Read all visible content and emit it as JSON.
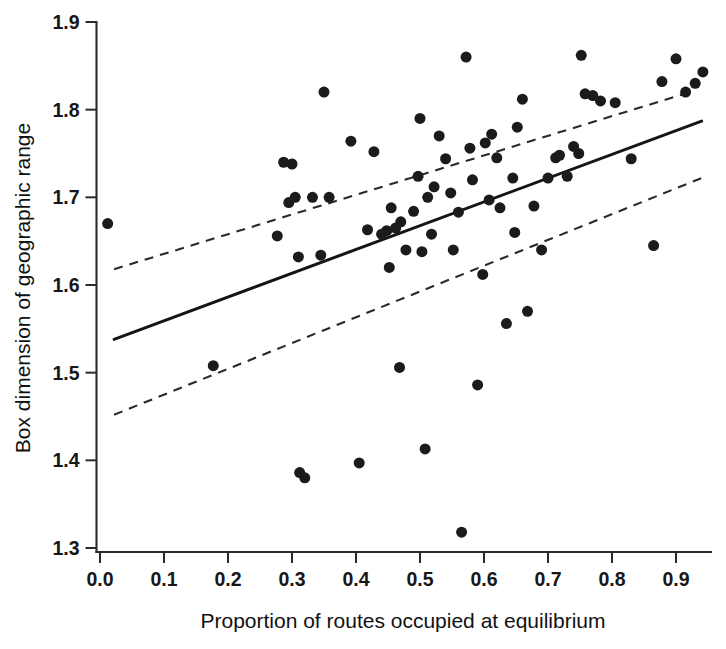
{
  "figure": {
    "background_color": "#ffffff",
    "ink_color": "#1b1b1b"
  },
  "chart_data": {
    "type": "scatter",
    "title": "",
    "xlabel": "Proportion of routes occupied at equilibrium",
    "ylabel": "Box dimension of geographic range",
    "xlim": [
      -0.005,
      0.955
    ],
    "ylim": [
      1.3,
      1.9
    ],
    "xticks": [
      0.0,
      0.1,
      0.2,
      0.3,
      0.4,
      0.5,
      0.6,
      0.7,
      0.8,
      0.9
    ],
    "xticklabels": [
      "0.0",
      "0.1",
      "0.2",
      "0.3",
      "0.4",
      "0.5",
      "0.6",
      "0.7",
      "0.8",
      "0.9"
    ],
    "yticks": [
      1.3,
      1.4,
      1.5,
      1.6,
      1.7,
      1.8,
      1.9
    ],
    "yticklabels": [
      "1.3",
      "1.4",
      "1.5",
      "1.6",
      "1.7",
      "1.8",
      "1.9"
    ],
    "grid": false,
    "legend": null,
    "marker": "filled-circle",
    "marker_size_px": 11,
    "points": [
      [
        0.012,
        1.67
      ],
      [
        0.177,
        1.508
      ],
      [
        0.277,
        1.656
      ],
      [
        0.287,
        1.74
      ],
      [
        0.295,
        1.694
      ],
      [
        0.3,
        1.738
      ],
      [
        0.305,
        1.7
      ],
      [
        0.31,
        1.632
      ],
      [
        0.312,
        1.386
      ],
      [
        0.32,
        1.38
      ],
      [
        0.332,
        1.7
      ],
      [
        0.345,
        1.634
      ],
      [
        0.35,
        1.82
      ],
      [
        0.358,
        1.7
      ],
      [
        0.392,
        1.764
      ],
      [
        0.405,
        1.397
      ],
      [
        0.418,
        1.663
      ],
      [
        0.428,
        1.752
      ],
      [
        0.44,
        1.658
      ],
      [
        0.448,
        1.662
      ],
      [
        0.452,
        1.62
      ],
      [
        0.455,
        1.688
      ],
      [
        0.462,
        1.665
      ],
      [
        0.468,
        1.506
      ],
      [
        0.47,
        1.672
      ],
      [
        0.478,
        1.64
      ],
      [
        0.49,
        1.684
      ],
      [
        0.497,
        1.724
      ],
      [
        0.5,
        1.79
      ],
      [
        0.503,
        1.638
      ],
      [
        0.508,
        1.413
      ],
      [
        0.512,
        1.7
      ],
      [
        0.518,
        1.658
      ],
      [
        0.522,
        1.712
      ],
      [
        0.53,
        1.77
      ],
      [
        0.54,
        1.744
      ],
      [
        0.548,
        1.705
      ],
      [
        0.552,
        1.64
      ],
      [
        0.56,
        1.683
      ],
      [
        0.565,
        1.318
      ],
      [
        0.572,
        1.86
      ],
      [
        0.578,
        1.756
      ],
      [
        0.582,
        1.72
      ],
      [
        0.59,
        1.486
      ],
      [
        0.598,
        1.612
      ],
      [
        0.602,
        1.762
      ],
      [
        0.608,
        1.697
      ],
      [
        0.612,
        1.772
      ],
      [
        0.62,
        1.745
      ],
      [
        0.625,
        1.688
      ],
      [
        0.635,
        1.556
      ],
      [
        0.645,
        1.722
      ],
      [
        0.648,
        1.66
      ],
      [
        0.652,
        1.78
      ],
      [
        0.66,
        1.812
      ],
      [
        0.668,
        1.57
      ],
      [
        0.678,
        1.69
      ],
      [
        0.69,
        1.64
      ],
      [
        0.7,
        1.722
      ],
      [
        0.712,
        1.745
      ],
      [
        0.718,
        1.748
      ],
      [
        0.73,
        1.724
      ],
      [
        0.74,
        1.758
      ],
      [
        0.748,
        1.75
      ],
      [
        0.752,
        1.862
      ],
      [
        0.758,
        1.818
      ],
      [
        0.77,
        1.816
      ],
      [
        0.782,
        1.81
      ],
      [
        0.805,
        1.808
      ],
      [
        0.83,
        1.744
      ],
      [
        0.865,
        1.645
      ],
      [
        0.878,
        1.832
      ],
      [
        0.9,
        1.858
      ],
      [
        0.915,
        1.82
      ],
      [
        0.93,
        1.83
      ],
      [
        0.942,
        1.843
      ]
    ],
    "lines": [
      {
        "name": "regression-fit",
        "style": "solid",
        "x": [
          0.022,
          0.94
        ],
        "y": [
          1.538,
          1.787
        ]
      },
      {
        "name": "confidence-upper",
        "style": "dashed",
        "x": [
          0.022,
          0.922
        ],
        "y": [
          1.618,
          1.82
        ]
      },
      {
        "name": "confidence-lower",
        "style": "dashed",
        "x": [
          0.022,
          0.94
        ],
        "y": [
          1.452,
          1.722
        ]
      }
    ]
  }
}
